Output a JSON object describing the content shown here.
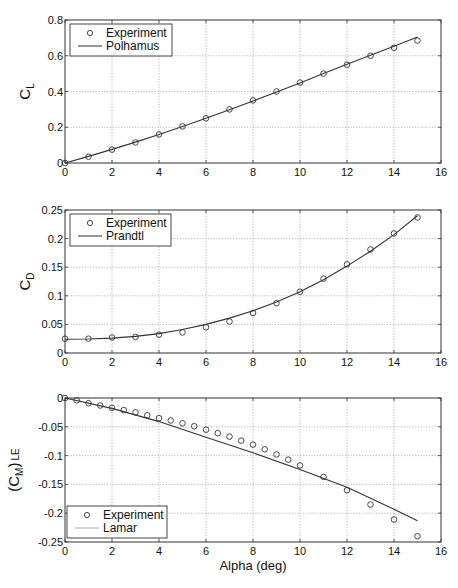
{
  "chart_data": [
    {
      "type": "line",
      "title": "",
      "xlabel": "",
      "ylabel": "C_L",
      "ylabel_main": "C",
      "ylabel_sub": "L",
      "xlim": [
        0,
        16
      ],
      "ylim": [
        0,
        0.8
      ],
      "xticks": [
        0,
        2,
        4,
        6,
        8,
        10,
        12,
        14,
        16
      ],
      "yticks": [
        0,
        0.2,
        0.4,
        0.6,
        0.8
      ],
      "ytick_labels": [
        "0",
        "0.2",
        "0.4",
        "0.6",
        "0.8"
      ],
      "grid": true,
      "legend_position": "upper left",
      "series": [
        {
          "name": "Experiment",
          "style": "markers-circle",
          "x": [
            0,
            1,
            2,
            3,
            4,
            5,
            6,
            7,
            8,
            9,
            10,
            11,
            12,
            13,
            14,
            15
          ],
          "y": [
            0.0,
            0.035,
            0.075,
            0.115,
            0.16,
            0.205,
            0.25,
            0.3,
            0.35,
            0.4,
            0.45,
            0.5,
            0.55,
            0.6,
            0.645,
            0.685
          ]
        },
        {
          "name": "Polhamus",
          "style": "line",
          "color": "#333333",
          "x": [
            0,
            1,
            2,
            3,
            4,
            5,
            6,
            7,
            8,
            9,
            10,
            11,
            12,
            13,
            14,
            15
          ],
          "y": [
            0.0,
            0.037,
            0.076,
            0.117,
            0.16,
            0.204,
            0.25,
            0.298,
            0.347,
            0.398,
            0.448,
            0.5,
            0.552,
            0.603,
            0.653,
            0.705
          ]
        }
      ]
    },
    {
      "type": "line",
      "title": "",
      "xlabel": "",
      "ylabel": "C_D",
      "ylabel_main": "C",
      "ylabel_sub": "D",
      "xlim": [
        0,
        16
      ],
      "ylim": [
        0,
        0.25
      ],
      "xticks": [
        0,
        2,
        4,
        6,
        8,
        10,
        12,
        14,
        16
      ],
      "yticks": [
        0,
        0.05,
        0.1,
        0.15,
        0.2,
        0.25
      ],
      "ytick_labels": [
        "0",
        "0.05",
        "0.1",
        "0.15",
        "0.2",
        "0.25"
      ],
      "grid": true,
      "legend_position": "upper left",
      "series": [
        {
          "name": "Experiment",
          "style": "markers-circle",
          "x": [
            0,
            1,
            2,
            3,
            4,
            5,
            6,
            7,
            8,
            9,
            10,
            11,
            12,
            13,
            14,
            15
          ],
          "y": [
            0.025,
            0.025,
            0.027,
            0.028,
            0.032,
            0.036,
            0.045,
            0.055,
            0.07,
            0.087,
            0.107,
            0.13,
            0.155,
            0.181,
            0.209,
            0.237
          ]
        },
        {
          "name": "Prandtl",
          "style": "line",
          "color": "#333333",
          "x": [
            0,
            1,
            2,
            3,
            4,
            5,
            6,
            7,
            8,
            9,
            10,
            11,
            12,
            13,
            14,
            15
          ],
          "y": [
            0.024,
            0.0245,
            0.026,
            0.029,
            0.034,
            0.041,
            0.05,
            0.061,
            0.074,
            0.089,
            0.107,
            0.128,
            0.152,
            0.178,
            0.207,
            0.24
          ]
        }
      ]
    },
    {
      "type": "line",
      "title": "",
      "xlabel": "Alpha (deg)",
      "ylabel": "(C_M)_LE",
      "ylabel_main": "(C",
      "ylabel_sub": "M",
      "ylabel_close": ")",
      "ylabel_sub2": "LE",
      "xlim": [
        0,
        16
      ],
      "ylim": [
        -0.25,
        0
      ],
      "xticks": [
        0,
        2,
        4,
        6,
        8,
        10,
        12,
        14,
        16
      ],
      "yticks": [
        -0.25,
        -0.2,
        -0.15,
        -0.1,
        -0.05,
        0
      ],
      "ytick_labels": [
        "-0.25",
        "-0.2",
        "-0.15",
        "-0.1",
        "-0.05",
        "0"
      ],
      "grid": true,
      "legend_position": "lower left",
      "series": [
        {
          "name": "Experiment",
          "style": "markers-circle",
          "x": [
            0,
            0.5,
            1,
            1.5,
            2,
            2.5,
            3,
            3.5,
            4,
            4.5,
            5,
            5.5,
            6,
            6.5,
            7,
            7.5,
            8,
            8.5,
            9,
            9.5,
            10,
            11,
            12,
            13,
            14,
            15
          ],
          "y": [
            0.0,
            -0.004,
            -0.009,
            -0.013,
            -0.017,
            -0.021,
            -0.025,
            -0.03,
            -0.035,
            -0.039,
            -0.044,
            -0.049,
            -0.055,
            -0.061,
            -0.067,
            -0.074,
            -0.081,
            -0.089,
            -0.098,
            -0.107,
            -0.117,
            -0.137,
            -0.16,
            -0.185,
            -0.211,
            -0.24
          ]
        },
        {
          "name": "Lamar",
          "style": "line",
          "color": "#333333",
          "x": [
            0,
            2,
            4,
            6,
            8,
            10,
            12,
            14,
            15
          ],
          "y": [
            0.0,
            -0.018,
            -0.041,
            -0.068,
            -0.095,
            -0.124,
            -0.155,
            -0.193,
            -0.213
          ]
        }
      ]
    }
  ]
}
